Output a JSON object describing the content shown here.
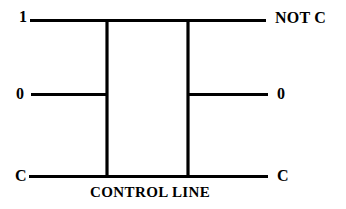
{
  "diagram": {
    "background_color": "#ffffff",
    "line_color": "#000000",
    "line_width": 3,
    "inputs": [
      {
        "id": "top-left",
        "label": "1"
      },
      {
        "id": "middle-left",
        "label": "0"
      },
      {
        "id": "bottom-left",
        "label": "C"
      }
    ],
    "outputs": [
      {
        "id": "top-right",
        "label": "NOT C"
      },
      {
        "id": "middle-right",
        "label": "0"
      },
      {
        "id": "bottom-right",
        "label": "C"
      }
    ],
    "caption": "CONTROL LINE",
    "wires": {
      "top_horizontal": {
        "x1": 30,
        "y1": 20.5,
        "x2": 266,
        "y2": 20.5
      },
      "middle_left_horizontal": {
        "x1": 31,
        "y1": 94.5,
        "x2": 108,
        "y2": 94.5
      },
      "middle_right_horizontal": {
        "x1": 188,
        "y1": 94.5,
        "x2": 268,
        "y2": 94.5
      },
      "bottom_horizontal": {
        "x1": 29,
        "y1": 176.5,
        "x2": 268,
        "y2": 176.5
      },
      "left_vertical": {
        "x1": 107,
        "y1": 19,
        "x2": 107,
        "y2": 178
      },
      "right_vertical": {
        "x1": 188,
        "y1": 19,
        "x2": 188,
        "y2": 178
      }
    }
  }
}
